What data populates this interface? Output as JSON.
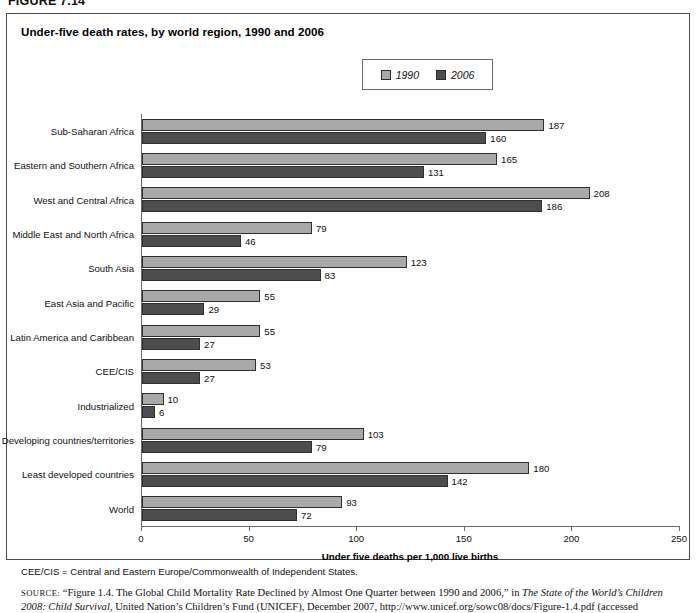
{
  "figure": {
    "label": "FIGURE 7.14"
  },
  "chart": {
    "title": "Under-five death rates, by world region, 1990 and 2006",
    "footnote": "CEE/CIS = Central and Eastern Europe/Commonwealth of Independent States."
  },
  "legend": {
    "items": [
      {
        "label": "1990",
        "color": "#a9a9a9",
        "swatch": "legend-swatch-1990"
      },
      {
        "label": "2006",
        "color": "#4d4d4d",
        "swatch": "legend-swatch-2006"
      }
    ]
  },
  "source": {
    "prefix": "SOURCE:",
    "text_1": " “Figure 1.4. The Global Child Mortality Rate Declined by Almost One Quarter between 1990 and 2006,” in ",
    "italic_1": "The State of the World’s Children 2008: Child Survival",
    "text_2": ", United Nation’s Children’s Fund (UNICEF), December 2007, http://www.unicef.org/sowc08/docs/Figure-1.4.pdf (accessed December 11, 2009). Copyright © UNICEF."
  },
  "chart_data": {
    "type": "bar",
    "orientation": "horizontal",
    "title": "Under-five death rates, by world region, 1990 and 2006",
    "xlabel": "Under five deaths per 1,000 live births",
    "ylabel": "",
    "xlim": [
      0,
      250
    ],
    "xticks": [
      0,
      50,
      100,
      150,
      200,
      250
    ],
    "grid": false,
    "legend_position": "top-center",
    "categories": [
      "Sub-Saharan Africa",
      "Eastern and Southern Africa",
      "West and Central Africa",
      "Middle East and North Africa",
      "South Asia",
      "East Asia and Pacific",
      "Latin America and Caribbean",
      "CEE/CIS",
      "Industrialized",
      "Developing countries/territories",
      "Least developed countries",
      "World"
    ],
    "series": [
      {
        "name": "1990",
        "color": "#a9a9a9",
        "values": [
          187,
          165,
          208,
          79,
          123,
          55,
          55,
          53,
          10,
          103,
          180,
          93
        ]
      },
      {
        "name": "2006",
        "color": "#4d4d4d",
        "values": [
          160,
          131,
          186,
          46,
          83,
          29,
          27,
          27,
          6,
          79,
          142,
          72
        ]
      }
    ]
  }
}
